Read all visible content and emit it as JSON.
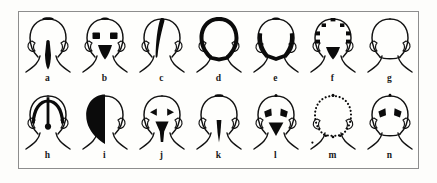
{
  "figure": {
    "view": "posterior head and neck outline",
    "panel_count": 14,
    "rows": 2,
    "columns": 7,
    "frame_color": "#8d8d8d",
    "ink_color": "#0b0b0b",
    "background_color": "#fefefc",
    "rows_data": [
      {
        "row_index": 1,
        "panels": [
          {
            "label": "a",
            "name": "panel-a",
            "pattern": "vertex patch with midline occipital-nuchal stripe",
            "marks": [
              "vertex-cap",
              "midline-nuchal-stripe"
            ]
          },
          {
            "label": "b",
            "name": "panel-b",
            "pattern": "small vertex patch, bilateral parietal squares, occipital wedge",
            "marks": [
              "vertex-cap",
              "left-parietal-square",
              "right-parietal-square",
              "occipital-wedge"
            ]
          },
          {
            "label": "c",
            "name": "panel-c",
            "pattern": "unilateral crescent stripe from vertex down left side",
            "marks": [
              "left-parasagittal-crescent"
            ]
          },
          {
            "label": "d",
            "name": "panel-d",
            "pattern": "full perimeter band around the head outline",
            "marks": [
              "complete-perimeter-band"
            ]
          },
          {
            "label": "e",
            "name": "panel-e",
            "pattern": "lower half band over temporal and occipital regions",
            "marks": [
              "vertex-cap",
              "bilateral-temporo-occipital-band"
            ]
          },
          {
            "label": "f",
            "name": "panel-f",
            "pattern": "discrete dots around head perimeter with occipital triangle",
            "marks": [
              "perimeter-dots",
              "occipital-triangle"
            ]
          },
          {
            "label": "g",
            "name": "panel-g",
            "pattern": "plain outline, no shaded area",
            "marks": []
          }
        ]
      },
      {
        "row_index": 2,
        "panels": [
          {
            "label": "h",
            "name": "panel-h",
            "pattern": "coronal band plus midline sagittal stripe ending in occipital dot",
            "marks": [
              "coronal-arch-band",
              "sagittal-midline-stripe",
              "occipital-dot"
            ]
          },
          {
            "label": "i",
            "name": "panel-i",
            "pattern": "entire left hemicranium filled",
            "marks": [
              "left-hemicranium-fill"
            ]
          },
          {
            "label": "j",
            "name": "panel-j",
            "pattern": "bilateral parietal triangles with occipital-nuchal wedge",
            "marks": [
              "left-parietal-triangle",
              "right-parietal-triangle",
              "occipital-nuchal-wedge"
            ]
          },
          {
            "label": "k",
            "name": "panel-k",
            "pattern": "small vertex patch with narrow nuchal stripe",
            "marks": [
              "vertex-cap",
              "narrow-nuchal-stripe"
            ]
          },
          {
            "label": "l",
            "name": "panel-l",
            "pattern": "bilateral parietal triangles with inverted occipital triangle",
            "marks": [
              "vertex-dot",
              "left-parietal-triangle",
              "right-parietal-triangle",
              "occipital-inverted-triangle"
            ]
          },
          {
            "label": "m",
            "name": "panel-m",
            "pattern": "head perimeter rendered as a ring of dots",
            "marks": [
              "dotted-perimeter-ring"
            ]
          },
          {
            "label": "n",
            "name": "panel-n",
            "pattern": "bilateral parietal triangles only",
            "marks": [
              "vertex-dot",
              "left-parietal-triangle",
              "right-parietal-triangle"
            ]
          }
        ]
      }
    ]
  }
}
